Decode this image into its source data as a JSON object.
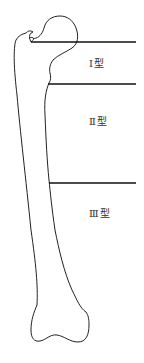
{
  "diagram": {
    "colors": {
      "outline": "#222222",
      "divider": "#111111",
      "label": "#333333"
    },
    "zones": [
      {
        "id": "type-1",
        "label": "Ⅰ型",
        "divider_y": 42
      },
      {
        "id": "type-2",
        "label": "Ⅱ型",
        "divider_y": 84
      },
      {
        "id": "type-3",
        "label": "Ⅲ型",
        "divider_y": 183
      }
    ]
  }
}
